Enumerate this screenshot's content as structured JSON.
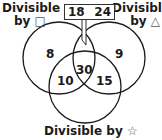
{
  "diagram": {
    "type": "venn-3-circle",
    "sets": [
      {
        "label_line1": "Divisible",
        "label_line2": "by",
        "symbol": "□",
        "symbol_name": "square-symbol"
      },
      {
        "label_line1": "Divisible",
        "label_line2": "by",
        "symbol": "△",
        "symbol_name": "triangle-symbol"
      },
      {
        "label_line1": "Divisible by",
        "symbol": "☆",
        "symbol_name": "star-symbol"
      }
    ],
    "regions": {
      "square_only": "8",
      "triangle_only": "9",
      "square_and_star": "10",
      "triangle_and_star": "15",
      "all_three": "30"
    },
    "callout": {
      "region": "square_and_triangle_only",
      "values": [
        "18",
        "24"
      ]
    },
    "colors": {
      "stroke": "#1a1a1a",
      "background": "#ffffff"
    }
  }
}
